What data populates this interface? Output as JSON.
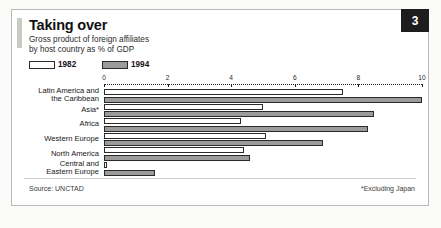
{
  "header": {
    "title": "Taking over",
    "subtitle_line1": "Gross product of foreign affiliates",
    "subtitle_line2": "by host country as % of GDP",
    "badge": "3"
  },
  "legend": {
    "items": [
      {
        "label": "1982",
        "color": "#ffffff",
        "name": "legend-1982"
      },
      {
        "label": "1994",
        "color": "#9b9b9b",
        "name": "legend-1994"
      }
    ]
  },
  "footer": {
    "source": "Source: UNCTAD",
    "footnote": "*Excluding Japan"
  },
  "chart_data": {
    "type": "bar",
    "orientation": "horizontal",
    "title": "Taking over",
    "subtitle": "Gross product of foreign affiliates by host country as % of GDP",
    "xlabel": "",
    "ylabel": "",
    "xlim": [
      0,
      10
    ],
    "ticks": [
      0,
      2,
      4,
      6,
      8,
      10
    ],
    "tick_labels": [
      "0",
      "2",
      "4",
      "6",
      "8",
      "10"
    ],
    "grid": false,
    "legend_position": "top-left",
    "categories": [
      "Latin America and\nthe Caribbean",
      "Asia*",
      "Africa",
      "Western Europe",
      "North America",
      "Central and\nEastern Europe"
    ],
    "category_lines": [
      [
        "Latin America and",
        "the Caribbean"
      ],
      [
        "Asia*"
      ],
      [
        "Africa"
      ],
      [
        "Western Europe"
      ],
      [
        "North America"
      ],
      [
        "Central and",
        "Eastern Europe"
      ]
    ],
    "series": [
      {
        "name": "1982",
        "color": "#ffffff",
        "values": [
          7.5,
          5.0,
          4.3,
          5.1,
          4.4,
          0.1
        ]
      },
      {
        "name": "1994",
        "color": "#9b9b9b",
        "values": [
          10.0,
          8.5,
          8.3,
          6.9,
          4.6,
          1.6
        ]
      }
    ],
    "source": "Source: UNCTAD",
    "annotation": "*Excluding Japan"
  }
}
